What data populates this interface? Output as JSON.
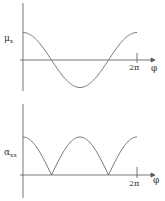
{
  "chart_data": [
    {
      "type": "line",
      "title": "",
      "ylabel": "μx",
      "ylabel_main": "μ",
      "ylabel_sub": "x",
      "xlabel": "φ",
      "x_ticks": [
        {
          "value": 6.2832,
          "label": "2π"
        }
      ],
      "xlim": [
        0,
        6.2832
      ],
      "ylim": [
        -1,
        1
      ],
      "grid": false,
      "series": [
        {
          "name": "μx = cos φ",
          "x": [
            0,
            0.785,
            1.571,
            2.356,
            3.1416,
            3.927,
            4.712,
            5.498,
            6.2832
          ],
          "y": [
            1,
            0.707,
            0,
            -0.707,
            -1,
            -0.707,
            0,
            0.707,
            1
          ]
        }
      ]
    },
    {
      "type": "line",
      "title": "",
      "ylabel": "αxx",
      "ylabel_main": "α",
      "ylabel_sub": "xx",
      "xlabel": "φ",
      "x_ticks": [
        {
          "value": 6.2832,
          "label": "2π"
        }
      ],
      "xlim": [
        0,
        6.2832
      ],
      "ylim": [
        0,
        1
      ],
      "grid": false,
      "series": [
        {
          "name": "αxx = |cos φ|",
          "x": [
            0,
            0.785,
            1.571,
            2.356,
            3.1416,
            3.927,
            4.712,
            5.498,
            6.2832
          ],
          "y": [
            1,
            0.707,
            0,
            0.707,
            1,
            0.707,
            0,
            0.707,
            1
          ]
        }
      ]
    }
  ],
  "labels": {
    "top_y": "μ",
    "top_y_sub": "x",
    "bottom_y": "α",
    "bottom_y_sub": "xx",
    "top_x": "φ",
    "bottom_x": "φ",
    "top_tick": "2π",
    "bottom_tick": "2π"
  }
}
